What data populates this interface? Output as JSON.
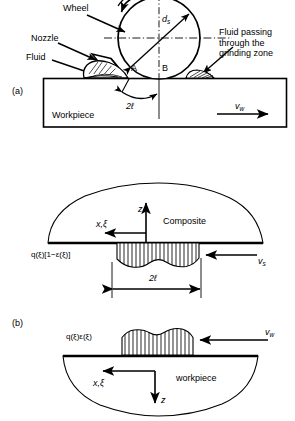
{
  "figure": {
    "type": "technical-schematic"
  },
  "panel_a": {
    "tag": "(a)",
    "labels": {
      "wheel": "Wheel",
      "nozzle": "Nozzle",
      "fluid": "Fluid",
      "fluid_passing": "Fluid passing through the grinding zone",
      "diameter": "d",
      "diameter_sub": "s",
      "point_a": "A",
      "point_b": "B",
      "contact_length": "2ℓ",
      "workpiece": "Workpiece",
      "velocity": "v",
      "velocity_sub": "w"
    }
  },
  "panel_b": {
    "tag": "(b)",
    "top": {
      "body_label": "Composite",
      "z_axis": "z",
      "x_axis": "x,ξ",
      "flux_label": "q(ξ)[1−ε(ξ)]",
      "contact_length": "2ℓ",
      "velocity": "v",
      "velocity_sub": "s"
    },
    "bottom": {
      "body_label": "workpiece",
      "z_axis": "z",
      "x_axis": "x,ξ",
      "flux_label": "q(ξ)ε(ξ)",
      "velocity": "v",
      "velocity_sub": "w"
    }
  },
  "colors": {
    "stroke": "#000000",
    "background": "#ffffff",
    "hatch": "#000000"
  }
}
